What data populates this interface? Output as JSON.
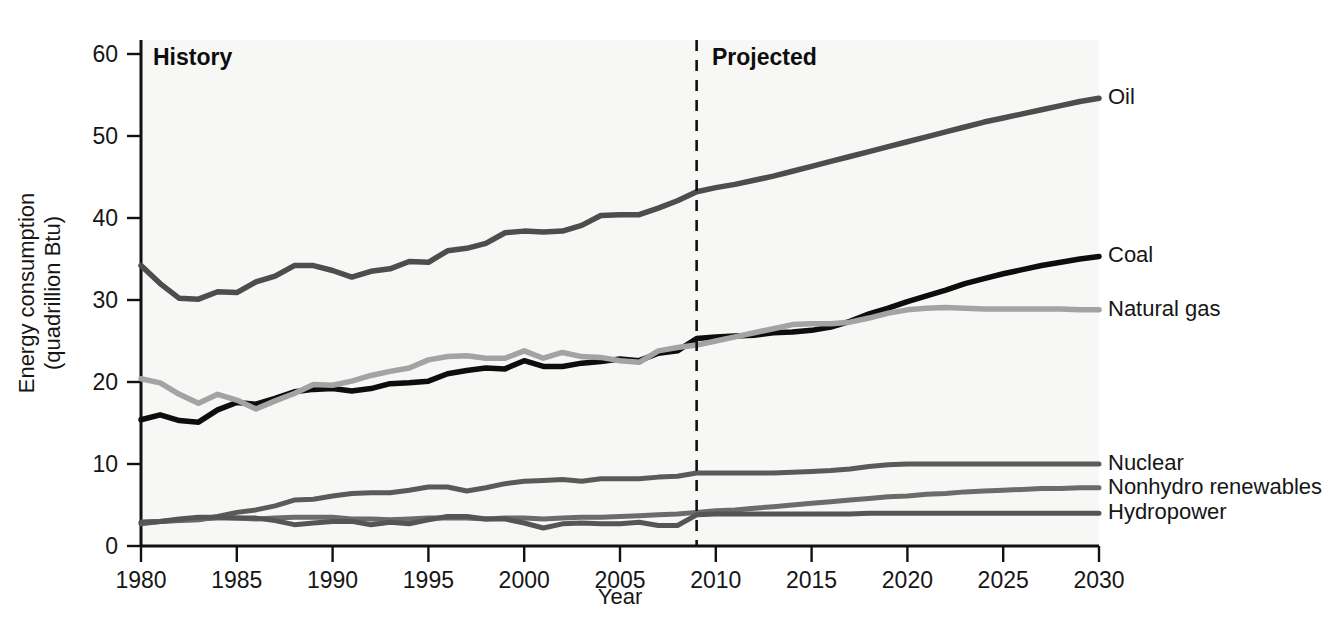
{
  "chart_data": {
    "type": "line",
    "title": "",
    "xlabel": "Year",
    "ylabel": "Energy consumption\n(quadrillion Btu)",
    "ylabel_line1": "Energy consumption",
    "ylabel_line2": "(quadrillion Btu)",
    "xlim": [
      1980,
      2030
    ],
    "ylim": [
      0,
      60
    ],
    "xticks": [
      1980,
      1985,
      1990,
      1995,
      2000,
      2005,
      2010,
      2015,
      2020,
      2025,
      2030
    ],
    "yticks": [
      0,
      10,
      20,
      30,
      40,
      50,
      60
    ],
    "grid": false,
    "legend_position": "right-inline-labels",
    "annotations": [
      {
        "id": "history",
        "text": "History",
        "x": 1981.5,
        "y": 57.5
      },
      {
        "id": "projected",
        "text": "Projected",
        "x": 2010.5,
        "y": 57.5
      }
    ],
    "divider": {
      "x": 2009,
      "style": "dashed",
      "label_left": "History",
      "label_right": "Projected"
    },
    "x": [
      1980,
      1981,
      1982,
      1983,
      1984,
      1985,
      1986,
      1987,
      1988,
      1989,
      1990,
      1991,
      1992,
      1993,
      1994,
      1995,
      1996,
      1997,
      1998,
      1999,
      2000,
      2001,
      2002,
      2003,
      2004,
      2005,
      2006,
      2007,
      2008,
      2009,
      2010,
      2011,
      2012,
      2013,
      2014,
      2015,
      2016,
      2017,
      2018,
      2019,
      2020,
      2021,
      2022,
      2023,
      2024,
      2025,
      2026,
      2027,
      2028,
      2029,
      2030
    ],
    "series": [
      {
        "name": "Oil",
        "color": "#4d4d4d",
        "width": 5.5,
        "label_y": 54.6,
        "values": [
          34.2,
          32.0,
          30.2,
          30.1,
          31.0,
          30.9,
          32.2,
          32.9,
          34.2,
          34.2,
          33.6,
          32.8,
          33.5,
          33.8,
          34.7,
          34.6,
          36.0,
          36.3,
          36.9,
          38.2,
          38.4,
          38.3,
          38.4,
          39.1,
          40.3,
          40.4,
          40.4,
          41.2,
          42.1,
          43.2,
          43.7,
          44.1,
          44.6,
          45.1,
          45.7,
          46.3,
          46.9,
          47.5,
          48.1,
          48.7,
          49.3,
          49.9,
          50.5,
          51.1,
          51.7,
          52.2,
          52.7,
          53.2,
          53.7,
          54.2,
          54.6
        ]
      },
      {
        "name": "Coal",
        "color": "#0d0d0d",
        "width": 5.5,
        "label_y": 35.3,
        "values": [
          15.4,
          16.0,
          15.3,
          15.1,
          16.6,
          17.5,
          17.3,
          18.0,
          18.8,
          19.1,
          19.2,
          18.9,
          19.2,
          19.8,
          19.9,
          20.1,
          21.0,
          21.4,
          21.7,
          21.6,
          22.6,
          21.9,
          21.9,
          22.3,
          22.5,
          22.8,
          22.6,
          23.5,
          23.8,
          25.3,
          25.5,
          25.6,
          25.7,
          26.0,
          26.1,
          26.3,
          26.7,
          27.4,
          28.3,
          29.0,
          29.8,
          30.5,
          31.2,
          32.0,
          32.6,
          33.2,
          33.7,
          34.2,
          34.6,
          35.0,
          35.3
        ]
      },
      {
        "name": "Natural gas",
        "color": "#a3a3a3",
        "width": 5.5,
        "label_y": 28.8,
        "values": [
          20.4,
          19.9,
          18.5,
          17.4,
          18.5,
          17.8,
          16.7,
          17.7,
          18.6,
          19.7,
          19.6,
          20.1,
          20.8,
          21.3,
          21.7,
          22.7,
          23.1,
          23.2,
          22.9,
          22.9,
          23.8,
          22.9,
          23.6,
          23.1,
          23.0,
          22.6,
          22.4,
          23.8,
          24.2,
          24.5,
          25.0,
          25.5,
          26.0,
          26.5,
          27.0,
          27.1,
          27.1,
          27.3,
          27.8,
          28.4,
          28.8,
          29.0,
          29.1,
          29.0,
          28.9,
          28.9,
          28.9,
          28.9,
          28.9,
          28.8,
          28.8
        ]
      },
      {
        "name": "Nuclear",
        "color": "#5a5a5a",
        "width": 5.0,
        "label_y": 10.0,
        "values": [
          2.7,
          3.0,
          3.1,
          3.2,
          3.6,
          4.1,
          4.4,
          4.9,
          5.6,
          5.7,
          6.1,
          6.4,
          6.5,
          6.5,
          6.8,
          7.2,
          7.2,
          6.7,
          7.1,
          7.6,
          7.9,
          8.0,
          8.1,
          7.9,
          8.2,
          8.2,
          8.2,
          8.4,
          8.5,
          8.9,
          8.9,
          8.9,
          8.9,
          8.9,
          9.0,
          9.1,
          9.2,
          9.4,
          9.7,
          9.9,
          10.0,
          10.0,
          10.0,
          10.0,
          10.0,
          10.0,
          10.0,
          10.0,
          10.0,
          10.0,
          10.0
        ]
      },
      {
        "name": "Nonhydro renewables",
        "color": "#6b6b6b",
        "width": 5.0,
        "label_y": 7.1,
        "values": [
          2.9,
          3.0,
          3.2,
          3.3,
          3.4,
          3.4,
          3.3,
          3.4,
          3.5,
          3.5,
          3.5,
          3.3,
          3.3,
          3.2,
          3.3,
          3.4,
          3.4,
          3.4,
          3.3,
          3.4,
          3.4,
          3.3,
          3.4,
          3.5,
          3.5,
          3.6,
          3.7,
          3.8,
          3.9,
          4.1,
          4.3,
          4.4,
          4.6,
          4.8,
          5.0,
          5.2,
          5.4,
          5.6,
          5.8,
          6.0,
          6.1,
          6.3,
          6.4,
          6.6,
          6.7,
          6.8,
          6.9,
          7.0,
          7.0,
          7.1,
          7.1
        ]
      },
      {
        "name": "Hydropower",
        "color": "#555555",
        "width": 5.0,
        "label_y": 4.0,
        "values": [
          2.9,
          3.0,
          3.3,
          3.5,
          3.5,
          3.4,
          3.4,
          3.1,
          2.6,
          2.8,
          3.0,
          3.0,
          2.6,
          2.9,
          2.7,
          3.2,
          3.6,
          3.6,
          3.3,
          3.3,
          2.8,
          2.2,
          2.7,
          2.8,
          2.7,
          2.7,
          2.9,
          2.5,
          2.5,
          3.8,
          3.9,
          3.9,
          3.9,
          3.9,
          3.9,
          3.9,
          3.9,
          3.9,
          4.0,
          4.0,
          4.0,
          4.0,
          4.0,
          4.0,
          4.0,
          4.0,
          4.0,
          4.0,
          4.0,
          4.0,
          4.0
        ]
      }
    ]
  },
  "colors": {
    "oil": "#4d4d4d",
    "coal": "#0d0d0d",
    "natural_gas": "#a3a3a3",
    "nuclear": "#5a5a5a",
    "nonhydro": "#6b6b6b",
    "hydropower": "#555555",
    "plot_background": "#f7f7f5",
    "axis": "#111111"
  }
}
